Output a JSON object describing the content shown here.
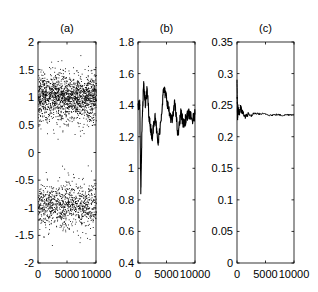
{
  "chart_data": [
    {
      "panel": "(a)",
      "type": "scatter",
      "title": "(a)",
      "xlabel": "",
      "ylabel": "",
      "xlim": [
        0,
        10000
      ],
      "ylim": [
        -2,
        2
      ],
      "xticks": [
        "0",
        "5000",
        "10000"
      ],
      "yticks": [
        "-2",
        "-1.5",
        "-1",
        "-0.5",
        "0",
        "0.5",
        "1",
        "1.5",
        "2"
      ],
      "grid": false,
      "description": "Dense point clouds around y≈1 (spread ~0.6–1.4) and y≈-1 (spread ~-1.4 to -0.6) across x 0–10000; upper cluster denser",
      "clusters": [
        {
          "center": 1.0,
          "spread": 0.2,
          "n": 1600,
          "outliers_range": [
            0.3,
            1.6
          ]
        },
        {
          "center": -0.95,
          "spread": 0.2,
          "n": 900,
          "outliers_range": [
            -1.7,
            -0.2
          ]
        }
      ]
    },
    {
      "panel": "(b)",
      "type": "line",
      "title": "(b)",
      "xlim": [
        0,
        10000
      ],
      "ylim": [
        0.4,
        1.8
      ],
      "xticks": [
        "0",
        "5000",
        "10000"
      ],
      "yticks": [
        "0.4",
        "0.6",
        "0.8",
        "1",
        "1.2",
        "1.4",
        "1.6",
        "1.8"
      ],
      "grid": false,
      "x": [
        0,
        300,
        500,
        700,
        1000,
        1300,
        1600,
        2000,
        2500,
        3000,
        3500,
        4000,
        4500,
        5000,
        5500,
        6000,
        6500,
        7000,
        7500,
        8000,
        8500,
        9000,
        9500,
        10000
      ],
      "y": [
        1.38,
        1.42,
        0.85,
        1.25,
        1.55,
        1.4,
        1.5,
        1.3,
        1.2,
        1.35,
        1.15,
        1.3,
        1.5,
        1.45,
        1.35,
        1.3,
        1.42,
        1.2,
        1.35,
        1.28,
        1.32,
        1.35,
        1.3,
        1.34
      ]
    },
    {
      "panel": "(c)",
      "type": "line",
      "title": "(c)",
      "xlim": [
        0,
        10000
      ],
      "ylim": [
        0,
        0.35
      ],
      "xticks": [
        "0",
        "5000",
        "10000"
      ],
      "yticks": [
        "0",
        "0.05",
        "0.1",
        "0.15",
        "0.2",
        "0.25",
        "0.3",
        "0.35"
      ],
      "grid": false,
      "x": [
        0,
        100,
        200,
        400,
        600,
        800,
        1000,
        1500,
        2000,
        2500,
        3000,
        4000,
        5000,
        6000,
        7000,
        8000,
        9000,
        10000
      ],
      "y": [
        0.29,
        0.23,
        0.245,
        0.235,
        0.248,
        0.24,
        0.238,
        0.232,
        0.236,
        0.233,
        0.237,
        0.236,
        0.236,
        0.234,
        0.235,
        0.234,
        0.235,
        0.235
      ]
    }
  ]
}
